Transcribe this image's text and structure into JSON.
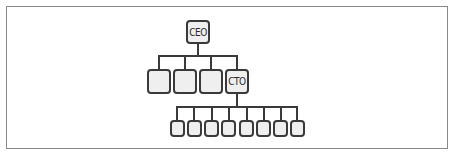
{
  "diagram": {
    "type": "org-chart",
    "root": {
      "label": "CEO"
    },
    "level1": [
      {
        "label": ""
      },
      {
        "label": ""
      },
      {
        "label": ""
      },
      {
        "label": "CTO"
      }
    ],
    "level2_under_cto": [
      {
        "label": ""
      },
      {
        "label": ""
      },
      {
        "label": ""
      },
      {
        "label": ""
      },
      {
        "label": ""
      },
      {
        "label": ""
      },
      {
        "label": ""
      },
      {
        "label": ""
      }
    ]
  },
  "colors": {
    "border": "#3a3a3a",
    "fill": "#efefef",
    "frame": "#8a8a8a"
  }
}
